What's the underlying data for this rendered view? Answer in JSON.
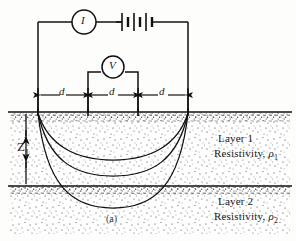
{
  "figure": {
    "caption": "(a)",
    "colors": {
      "ink": "#111111",
      "stipple": "#2b2b2b",
      "paper": "#fdfdfb"
    },
    "circuit": {
      "ammeter_label": "I",
      "ammeter_name": "ammeter",
      "voltmeter_label": "V",
      "voltmeter_name": "voltmeter",
      "battery_name": "battery-cells",
      "battery_cell_count": 3
    },
    "spacings": [
      {
        "label": "d",
        "name": "spacing-left"
      },
      {
        "label": "d",
        "name": "spacing-middle"
      },
      {
        "label": "d",
        "name": "spacing-right"
      }
    ],
    "depth": {
      "label": "Z",
      "subscript": "1"
    },
    "layers": [
      {
        "name": "Layer 1",
        "resistivity_prefix": "Resistivity, ",
        "resistivity_symbol": "ρ",
        "resistivity_subscript": "1"
      },
      {
        "name": "Layer 2",
        "resistivity_prefix": "Resistivity, ",
        "resistivity_symbol": "ρ",
        "resistivity_subscript": "2"
      }
    ],
    "electrodes": [
      {
        "name": "current-electrode-left",
        "x": 38
      },
      {
        "name": "potential-electrode-left",
        "x": 88
      },
      {
        "name": "potential-electrode-right",
        "x": 138
      },
      {
        "name": "current-electrode-right",
        "x": 188
      }
    ],
    "current_flow_lines": 3
  }
}
